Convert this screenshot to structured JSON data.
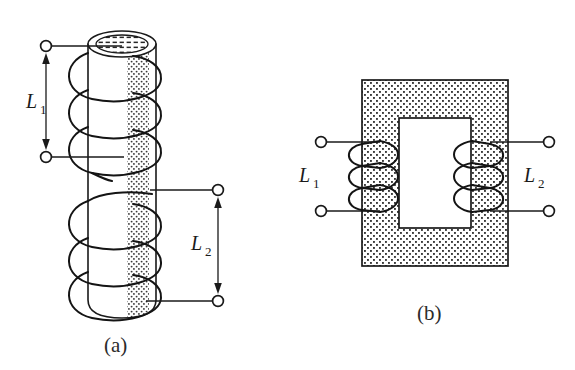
{
  "figure": {
    "background_color": "#ffffff",
    "ink_color": "#1a1a1a",
    "panels": [
      {
        "id": "panel-a",
        "caption": "(a)",
        "core_type": "solid cylindrical rod core",
        "core_shading": "stippled dotted band on right face of cylinder",
        "windings": [
          {
            "name": "L1",
            "label_letter": "L",
            "label_subscript": "1",
            "position": "upper section of rod",
            "turns": 3,
            "lead_side": "left",
            "terminals": 2
          },
          {
            "name": "L2",
            "label_letter": "L",
            "label_subscript": "2",
            "position": "lower section of rod",
            "turns": 3,
            "lead_side": "right",
            "terminals": 2
          }
        ],
        "dimension_arrows": [
          {
            "for": "L1",
            "orientation": "vertical",
            "heads": "both"
          },
          {
            "for": "L2",
            "orientation": "vertical",
            "heads": "both"
          }
        ]
      },
      {
        "id": "panel-b",
        "caption": "(b)",
        "core_type": "closed rectangular (window) core",
        "core_shading": "stippled dot fill over core cross-section",
        "windings": [
          {
            "name": "L1",
            "label_letter": "L",
            "label_subscript": "1",
            "position": "left leg of core",
            "turns": 3,
            "lead_side": "left",
            "terminals": 2
          },
          {
            "name": "L2",
            "label_letter": "L",
            "label_subscript": "2",
            "position": "right leg of core",
            "turns": 3,
            "lead_side": "right",
            "terminals": 2
          }
        ]
      }
    ],
    "labels": {
      "l1_letter": "L",
      "l1_subscript": "1",
      "l2_letter": "L",
      "l2_subscript": "2",
      "caption_a": "(a)",
      "caption_b": "(b)"
    }
  }
}
